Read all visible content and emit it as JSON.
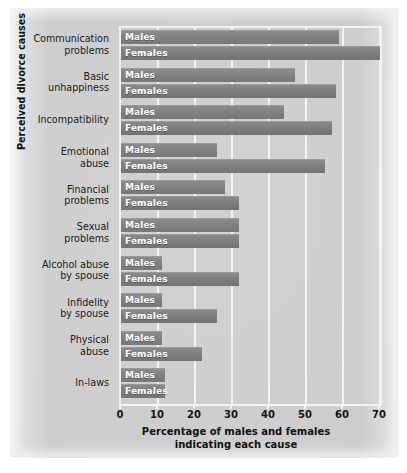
{
  "chart_data": {
    "type": "bar",
    "orientation": "horizontal",
    "title": "",
    "xlabel": "Percentage of males and females indicating each cause",
    "xlabel_line1": "Percentage of males and females",
    "xlabel_line2": "indicating each cause",
    "ylabel": "Perceived divorce causes",
    "xlim": [
      0,
      70
    ],
    "xticks": [
      0,
      10,
      20,
      30,
      40,
      50,
      60,
      70
    ],
    "grid": true,
    "grid_axis": "x",
    "legend": "in-bar labels",
    "categories": [
      "Communication problems",
      "Basic unhappiness",
      "Incompatibility",
      "Emotional abuse",
      "Financial problems",
      "Sexual problems",
      "Alcohol abuse by spouse",
      "Infidelity by spouse",
      "Physical abuse",
      "In-laws"
    ],
    "category_lines": [
      [
        "Communication",
        "problems"
      ],
      [
        "Basic",
        "unhappiness"
      ],
      [
        "Incompatibility"
      ],
      [
        "Emotional",
        "abuse"
      ],
      [
        "Financial",
        "problems"
      ],
      [
        "Sexual",
        "problems"
      ],
      [
        "Alcohol abuse",
        "by spouse"
      ],
      [
        "Infidelity",
        "by spouse"
      ],
      [
        "Physical",
        "abuse"
      ],
      [
        "In-laws"
      ]
    ],
    "series": [
      {
        "name": "Males",
        "label": "Males",
        "color": "#828282",
        "values": [
          59,
          47,
          44,
          26,
          28,
          32,
          11,
          11,
          11,
          12
        ]
      },
      {
        "name": "Females",
        "label": "Females",
        "color": "#7e7e7e",
        "values": [
          70,
          58,
          57,
          55,
          32,
          32,
          32,
          26,
          22,
          12
        ]
      }
    ]
  },
  "axis": {
    "tick_labels": [
      "0",
      "10",
      "20",
      "30",
      "40",
      "50",
      "60",
      "70"
    ]
  },
  "colors": {
    "plate": "#cdcdcd",
    "bar": "#828282",
    "gridline": "#f4f4f4",
    "bar_text": "#ffffff",
    "axis_text": "#141414"
  }
}
